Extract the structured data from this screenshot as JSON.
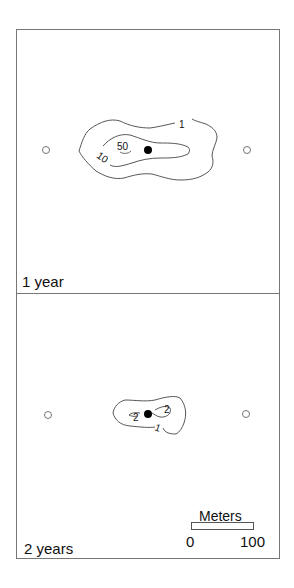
{
  "panels": [
    {
      "label": "1 year",
      "contour_labels": [
        "1",
        "10",
        "50"
      ],
      "center_marker": "filled-circle",
      "side_markers": [
        "open-circle",
        "open-circle"
      ]
    },
    {
      "label": "2 years",
      "contour_labels": [
        "1",
        "2",
        "2"
      ],
      "center_marker": "filled-circle",
      "side_markers": [
        "open-circle",
        "open-circle"
      ]
    }
  ],
  "scale_bar": {
    "title": "Meters",
    "min_label": "0",
    "max_label": "100"
  },
  "colors": {
    "frame": "#777777",
    "contour": "#444444",
    "marker": "#000000",
    "background": "#ffffff"
  }
}
